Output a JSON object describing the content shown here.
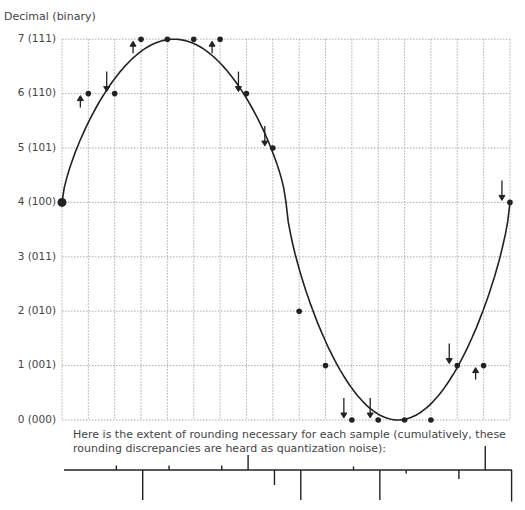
{
  "chart_data": {
    "type": "scatter",
    "title": "",
    "ylabel": "Decimal  (binary)",
    "xlabel": "",
    "ylim": [
      0,
      7
    ],
    "y_ticks": [
      "0 (000)",
      "1 (001)",
      "2 (010)",
      "3 (011)",
      "4 (100)",
      "5 (101)",
      "6 (110)",
      "7 (111)"
    ],
    "grid": true,
    "sample_index": [
      0,
      1,
      2,
      3,
      4,
      5,
      6,
      7,
      8,
      9,
      10,
      11,
      12,
      13,
      14,
      15,
      16,
      17
    ],
    "quantized_values": [
      4,
      6,
      6,
      7,
      7,
      7,
      7,
      6,
      5,
      2,
      1,
      0,
      0,
      0,
      0,
      1,
      1,
      4
    ],
    "rounding_direction": [
      "none",
      "up",
      "down",
      "up",
      "none",
      "none",
      "up",
      "down",
      "down",
      "none",
      "none",
      "down",
      "down",
      "none",
      "none",
      "down",
      "up",
      "down"
    ],
    "curve": "one cycle of a sine-like wave from 4, peaking near 7, troughing near 0, returning to 4",
    "caption": "Here is the extent of rounding necessary for each sample (cumulatively, these rounding discrepancies are heard as quantization noise):",
    "error_marks": [
      0,
      0.15,
      -1.0,
      0.15,
      0,
      0.15,
      0.5,
      -0.5,
      -1.0,
      0,
      0.12,
      -1.0,
      -0.12,
      0,
      -0.3,
      0.8,
      -1.05,
      0
    ]
  },
  "labels": {
    "ytitle": "Decimal  (binary)",
    "y7": "7  (111)",
    "y6": "6  (110)",
    "y5": "5  (101)",
    "y4": "4  (100)",
    "y3": "3  (011)",
    "y2": "2  (010)",
    "y1": "1  (001)",
    "y0": "0  (000)",
    "caption": "Here is the extent of rounding necessary for each sample (cumulatively, these rounding discrepancies are heard as quantization noise):"
  }
}
